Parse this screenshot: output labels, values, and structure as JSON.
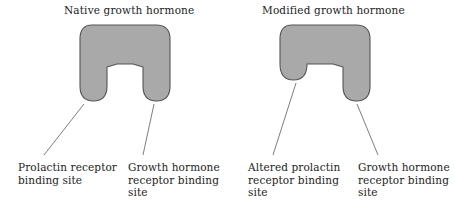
{
  "figure": {
    "background_color": "#ffffff",
    "shape_fill_color": "#a9a9a9",
    "shape_stroke_color": "#555555",
    "leader_line_color": "#6e6e6e",
    "text_color": "#1c1c1c"
  },
  "panels": {
    "left": {
      "title": "Native growth hormone",
      "captions": {
        "prolactin": "Prolactin receptor binding site",
        "growth_hormone": "Growth hormone receptor binding site"
      }
    },
    "right": {
      "title": "Modified growth hormone",
      "captions": {
        "prolactin": "Altered prolactin receptor binding site",
        "growth_hormone": "Growth hormone receptor binding site"
      }
    }
  }
}
